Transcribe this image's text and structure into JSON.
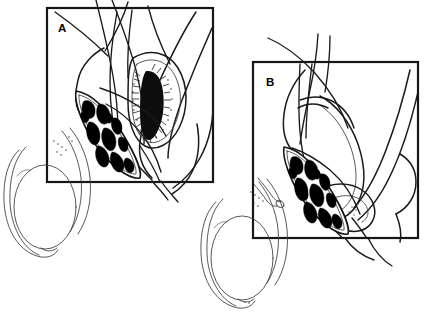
{
  "figure": {
    "background_color": "#ffffff",
    "ink_color": "#1a1a1a",
    "width": 424,
    "height": 313,
    "style": "black-and-white pen-and-ink medical line art"
  },
  "panels": [
    {
      "id": "panel-a",
      "label": "A",
      "label_x": 58,
      "label_y": 32,
      "frame": {
        "x": 47,
        "y": 8,
        "w": 166,
        "h": 174
      },
      "caption": "",
      "features": [
        "spermatic cord cross-section with pampiniform plexus veins",
        "dark stippled hemorrhagic region within opened tunica",
        "incised tunica vaginalis flaps",
        "suture / vessel strands crossing frame"
      ]
    },
    {
      "id": "panel-b",
      "label": "B",
      "label_x": 266,
      "label_y": 86,
      "frame": {
        "x": 253,
        "y": 62,
        "w": 165,
        "h": 176
      },
      "caption": "",
      "features": [
        "spermatic cord cross-section with pampiniform plexus veins",
        "everted tunica vaginalis forming a looped collar",
        "transected tubular stump adjacent to the testis",
        "suture / vessel strands crossing frame"
      ]
    }
  ],
  "anatomy": {
    "left_testis": {
      "name": "testis-left",
      "cx": 47,
      "cy": 207,
      "rx": 31,
      "ry": 42,
      "epididymis": "crescent epididymis along lateral border"
    },
    "right_testis": {
      "name": "testis-right",
      "cx": 243,
      "cy": 258,
      "rx": 31,
      "ry": 42,
      "epididymis": "crescent epididymis along lateral border"
    },
    "cord_section_a": {
      "name": "spermatic-cord-cross-section-a",
      "vein_count": 11,
      "shape": "pointed-oval (lenticular) section"
    },
    "cord_section_b": {
      "name": "spermatic-cord-cross-section-b",
      "vein_count": 12,
      "shape": "pointed-oval (lenticular) section"
    },
    "lesion_a": {
      "name": "hemorrhagic-region",
      "description": "dense black stippled elongated area inside panel A tunica window"
    },
    "tube_stump_b": {
      "name": "transected-tube-stump",
      "description": "small cut-end tube with open lumen near right testis"
    }
  },
  "colors": {
    "background": "#ffffff",
    "frame_stroke": "#161616",
    "primary_stroke": "#1a1a1a",
    "secondary_stroke": "#3a3a3a",
    "faint_stroke": "#5a5a5a",
    "vessel_lumen": "#000000"
  }
}
